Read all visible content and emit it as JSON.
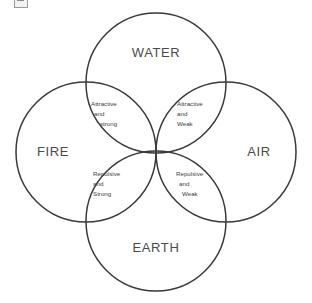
{
  "diagram": {
    "background_color": "#ffffff",
    "stroke_color": "#3a3a3a",
    "text_color": "#4a4a4a",
    "elements": [
      {
        "id": "water",
        "label": "WATER",
        "position": "top",
        "center_x": 156,
        "center_y": 83,
        "radius": 70
      },
      {
        "id": "fire",
        "label": "FIRE",
        "position": "left",
        "center_x": 86,
        "center_y": 152,
        "radius": 70
      },
      {
        "id": "air",
        "label": "AIR",
        "position": "right",
        "center_x": 226,
        "center_y": 152,
        "radius": 70
      },
      {
        "id": "earth",
        "label": "EARTH",
        "position": "bottom",
        "center_x": 156,
        "center_y": 221,
        "radius": 70
      }
    ],
    "overlaps": [
      {
        "id": "fire-water",
        "between": "FIRE + WATER",
        "line1": "Attractive",
        "line2": "and",
        "line3": "strong"
      },
      {
        "id": "water-air",
        "between": "WATER + AIR",
        "line1": "Attractive",
        "line2": "and",
        "line3": "Weak"
      },
      {
        "id": "fire-earth",
        "between": "FIRE + EARTH",
        "line1": "Repulsive",
        "line2": "and",
        "line3": "Strong"
      },
      {
        "id": "earth-air",
        "between": "EARTH + AIR",
        "line1": "Repulsive",
        "line2": "and",
        "line3": "Weak"
      }
    ],
    "artifact": {
      "name": "broken-image-placeholder",
      "description": "clipped placeholder icon at top-left edge"
    }
  }
}
